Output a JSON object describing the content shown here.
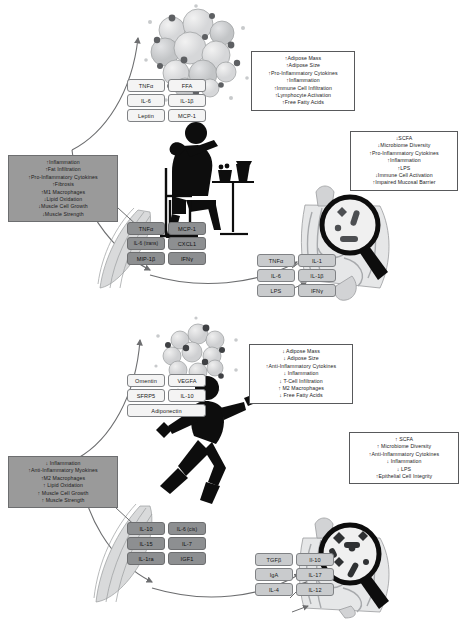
{
  "figure": {
    "type": "cycle-diagram",
    "panels": 2,
    "colors": {
      "outcome_box_fill": "#ffffff",
      "muscle_outcome_box_fill": "#9a9a9a",
      "adipokine_chip_fill": "#f4f4f4",
      "myokine_chip_fill": "#8d8f91",
      "gut_chip_fill": "#c9cbcd",
      "arrow": "#6d6e70"
    }
  },
  "obese_panel": {
    "name": "Obesity / Sedentary cycle",
    "human_figure": "sedentary-person-eating-fast-food",
    "adipose_icon": "enlarged-adipocyte-cluster-with-macrophages",
    "gut_icon": "intestine-with-magnifier-low-diversity-microbiota",
    "muscle_icon": "skeletal-muscle-fibers",
    "adipose_chips": [
      "TNFα",
      "FFA",
      "IL-6",
      "IL-1β",
      "Leptin",
      "MCP-1"
    ],
    "adipose_outcomes": [
      "↑Adipose Mass",
      "↑Adipose Size",
      "↑Pro-Inflammatory Cytokines",
      "↑Inflammation",
      "↑Immune Cell Infiltration",
      "↑Lymphocyte Activation",
      "↑Free Fatty Acids"
    ],
    "gut_outcomes": [
      "↓SCFA",
      "↓Microbiome Diversity",
      "↑Pro-Inflammatory Cytokines",
      "↑Inflammation",
      "↑LPS",
      "↓Immune Cell Activation",
      "↑Impaired Mucosal Barrier"
    ],
    "gut_chips": [
      "TNFα",
      "IL-1",
      "IL-6",
      "IL-1β",
      "LPS",
      "IFNγ"
    ],
    "muscle_outcomes": [
      "↑Inflammation",
      "↑Fat Infiltration",
      "↑Pro-Inflammatory Cytokines",
      "↑Fibrosis",
      "↑M1 Macrophages",
      "↓Lipid Oxidation",
      "↓Muscle Cell Growth",
      "↓Muscle Strength"
    ],
    "muscle_chips": [
      "TNFα",
      "MCP-1",
      "IL-6 (trans)",
      "CXCL1",
      "MIP-1β",
      "IFNγ"
    ]
  },
  "exercise_panel": {
    "name": "Exercise cycle",
    "human_figure": "running-person",
    "adipose_icon": "small-adipocyte-cluster",
    "gut_icon": "intestine-with-magnifier-high-diversity-microbiota",
    "muscle_icon": "skeletal-muscle-fibers",
    "adipose_chips": [
      "Omentin",
      "VEGFA",
      "SFRP5",
      "IL-10",
      "Adiponectin"
    ],
    "adipose_outcomes": [
      "↓ Adipose Mass",
      "↓ Adipose Size",
      "↑Anti-Inflammatory Cytokines",
      "↓ Inflammation",
      "↓ T-Cell Infiltration",
      "↑ M2 Macrophages",
      "↓ Free Fatty Acids"
    ],
    "gut_outcomes": [
      "↑ SCFA",
      "↑ Microbiome Diversity",
      "↑Anti-Inflammatory Cytokines",
      "↓ Inflammation",
      "↓ LPS",
      "↑Epithelial Cell Integrity"
    ],
    "gut_chips": [
      "TGFβ",
      "Il-10",
      "IgA",
      "IL-17",
      "IL-4",
      "IL-12"
    ],
    "muscle_outcomes": [
      "↓ Inflammation",
      "↑Anti-Inflammatory Myokines",
      "↑M2 Macrophages",
      "↑ Lipid Oxidation",
      "↑ Muscle Cell Growth",
      "↑ Muscle Strength"
    ],
    "muscle_chips": [
      "IL-10",
      "IL-6 (cis)",
      "IL-15",
      "IL-7",
      "IL-1ra",
      "IGF1"
    ]
  }
}
